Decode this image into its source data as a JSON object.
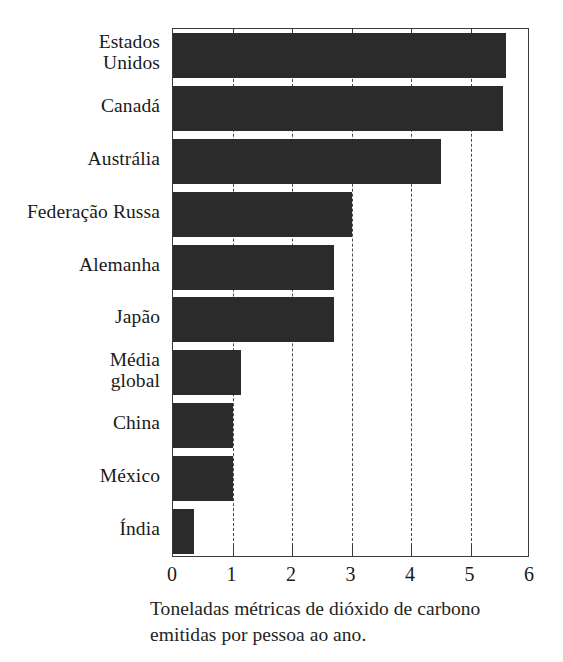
{
  "chart_data": {
    "type": "bar",
    "orientation": "horizontal",
    "title": "",
    "subtitle": "",
    "xlabel": "Toneladas métricas de dióxido de carbono emitidas por pessoa ao ano.",
    "ylabel": "",
    "categories": [
      "Estados\nUnidos",
      "Canadá",
      "Austrália",
      "Federação Russa",
      "Alemanha",
      "Japão",
      "Média\nglobal",
      "China",
      "México",
      "Índia"
    ],
    "values": [
      5.6,
      5.55,
      4.5,
      3.0,
      2.7,
      2.7,
      1.15,
      1.0,
      1.0,
      0.35
    ],
    "xlim": [
      0,
      6
    ],
    "xticks": [
      0,
      1,
      2,
      3,
      4,
      5,
      6
    ],
    "xticklabels": [
      "0",
      "1",
      "2",
      "3",
      "4",
      "5",
      "6"
    ],
    "grid": "vertical-dashed",
    "legend": "none",
    "bar_color": "#2b2b2b",
    "frame_color": "#3a3a3a",
    "gridline_color": "#4a4a4a"
  },
  "caption": {
    "line1": "Toneladas métricas de dióxido de carbono",
    "line2": "emitidas por pessoa ao ano."
  }
}
